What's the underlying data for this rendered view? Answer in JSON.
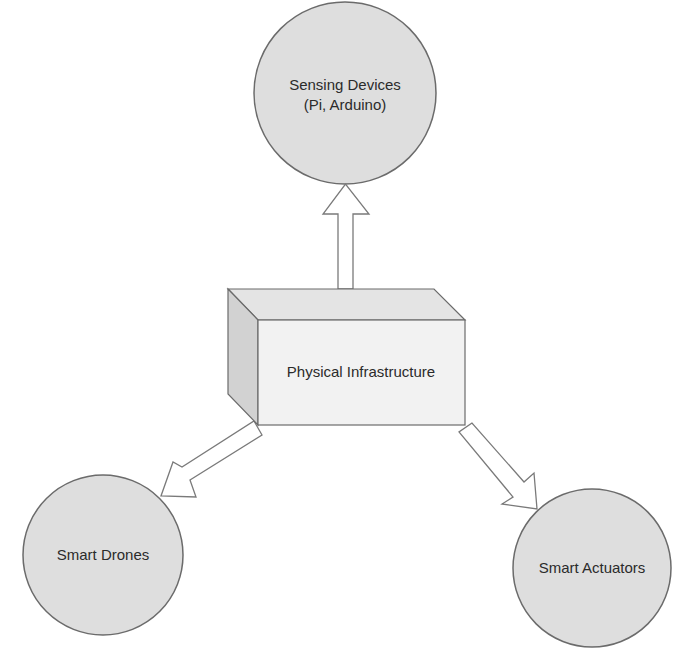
{
  "diagram": {
    "colors": {
      "node_fill": "#dedede",
      "node_stroke": "#6b6b6b",
      "box_front": "#f2f2f2",
      "box_top": "#e4e4e4",
      "box_side": "#d2d2d2",
      "arrow_fill": "#ffffff",
      "arrow_stroke": "#7a7a7a",
      "text": "#2b2b2b"
    },
    "center_node": {
      "shape": "3d-box",
      "label": "Physical Infrastructure"
    },
    "nodes": [
      {
        "id": "sensing",
        "shape": "circle",
        "label_line1": "Sensing Devices",
        "label_line2": "(Pi, Arduino)"
      },
      {
        "id": "drones",
        "shape": "circle",
        "label": "Smart Drones"
      },
      {
        "id": "actuators",
        "shape": "circle",
        "label": "Smart Actuators"
      }
    ],
    "edges": [
      {
        "from": "Physical Infrastructure",
        "to": "Sensing Devices (Pi, Arduino)",
        "style": "hollow-block-arrow"
      },
      {
        "from": "Physical Infrastructure",
        "to": "Smart Drones",
        "style": "hollow-block-arrow"
      },
      {
        "from": "Physical Infrastructure",
        "to": "Smart Actuators",
        "style": "hollow-block-arrow"
      }
    ]
  }
}
